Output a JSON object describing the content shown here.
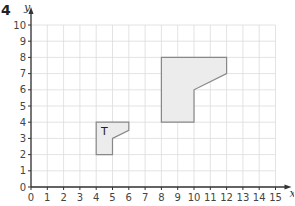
{
  "question_number": "4",
  "chart_data": {
    "type": "diagram",
    "title": "",
    "xlabel": "x",
    "ylabel": "y",
    "xlim": [
      0,
      15
    ],
    "ylim": [
      0,
      10
    ],
    "grid": true,
    "x_ticks": [
      "0",
      "1",
      "2",
      "3",
      "4",
      "5",
      "6",
      "7",
      "8",
      "9",
      "10",
      "11",
      "12",
      "13",
      "14",
      "15"
    ],
    "y_ticks": [
      "0",
      "1",
      "2",
      "3",
      "4",
      "5",
      "6",
      "7",
      "8",
      "9",
      "10"
    ],
    "shapes": [
      {
        "name": "T",
        "label": "T",
        "label_pos": [
          4.5,
          3.2
        ],
        "vertices": [
          [
            4,
            2
          ],
          [
            5,
            2
          ],
          [
            5,
            3
          ],
          [
            6,
            3.5
          ],
          [
            6,
            4
          ],
          [
            4,
            4
          ]
        ]
      },
      {
        "name": "image",
        "label": "",
        "vertices": [
          [
            8,
            4
          ],
          [
            10,
            4
          ],
          [
            10,
            6
          ],
          [
            12,
            7
          ],
          [
            12,
            8
          ],
          [
            8,
            8
          ]
        ]
      }
    ]
  },
  "colors": {
    "grid": "#dcdcdc",
    "axis": "#333333",
    "shape_fill": "#ececec",
    "shape_stroke": "#888888"
  }
}
